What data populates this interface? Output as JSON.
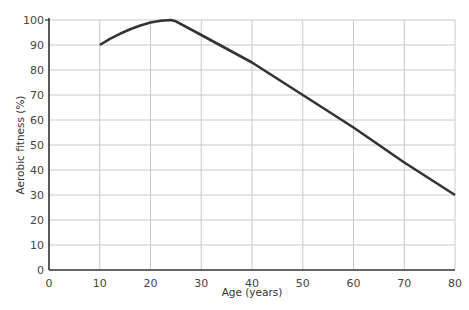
{
  "chart_data": {
    "type": "line",
    "title": "",
    "xlabel": "Age (years)",
    "ylabel": "Aerobic fitness (%)",
    "xlim": [
      0,
      80
    ],
    "ylim": [
      0,
      100
    ],
    "x_ticks": [
      0,
      10,
      20,
      30,
      40,
      50,
      60,
      70,
      80
    ],
    "y_ticks": [
      0,
      10,
      20,
      30,
      40,
      50,
      60,
      70,
      80,
      90,
      100
    ],
    "grid": true,
    "legend": null,
    "series": [
      {
        "name": "Aerobic fitness",
        "color": "#333333",
        "x": [
          10,
          12,
          14,
          16,
          18,
          20,
          22,
          24,
          25,
          30,
          40,
          50,
          60,
          70,
          80
        ],
        "y": [
          90,
          92.5,
          94.5,
          96.3,
          97.8,
          99,
          99.7,
          100,
          99.5,
          94,
          83,
          70,
          57,
          43,
          30
        ]
      }
    ]
  }
}
